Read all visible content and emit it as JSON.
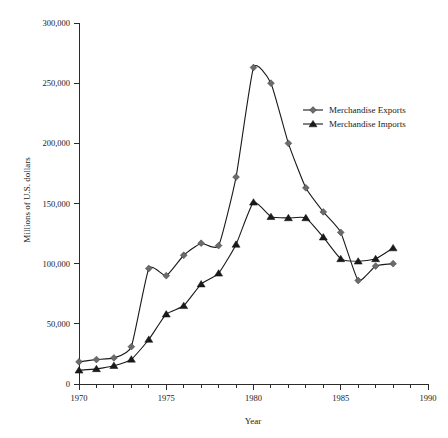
{
  "chart_data": {
    "type": "line",
    "title": "",
    "xlabel": "Year",
    "ylabel": "Millions of U.S. dollars",
    "xlim": [
      1970,
      1990
    ],
    "ylim": [
      0,
      300000
    ],
    "grid": false,
    "legend_position": "inside-right-upper",
    "x_major_ticks": [
      1970,
      1975,
      1980,
      1985,
      1990
    ],
    "x_major_tick_labels": [
      "1970",
      "1975",
      "1980",
      "1985",
      "1990"
    ],
    "x_minor_tick_step": 1,
    "y_ticks": [
      0,
      50000,
      100000,
      150000,
      200000,
      250000,
      300000
    ],
    "y_tick_labels": [
      "0",
      "50,000",
      "100,000",
      "150,000",
      "200,000",
      "250,000",
      "300,000"
    ],
    "x": [
      1970,
      1971,
      1972,
      1973,
      1974,
      1975,
      1976,
      1977,
      1978,
      1979,
      1980,
      1981,
      1982,
      1983,
      1984,
      1985,
      1986,
      1987,
      1988
    ],
    "series": [
      {
        "name": "Merchandise Exports",
        "marker": "diamond",
        "marker_color": "#6b6b6b",
        "line_color": "#1a1a1a",
        "values": [
          18400,
          20300,
          21700,
          31000,
          96000,
          90000,
          107000,
          117000,
          115000,
          172000,
          263000,
          250000,
          200000,
          163000,
          143000,
          126000,
          86000,
          98000,
          100000
        ]
      },
      {
        "name": "Merchandise Imports",
        "marker": "triangle",
        "marker_color": "#1a1a1a",
        "line_color": "#1a1a1a",
        "values": [
          11400,
          12600,
          15200,
          20500,
          37000,
          58000,
          65000,
          83000,
          92000,
          116000,
          151000,
          139000,
          138000,
          138000,
          122000,
          104000,
          102000,
          104000,
          113000
        ]
      }
    ]
  },
  "legend": {
    "entries": [
      {
        "label": "Merchandise Exports"
      },
      {
        "label": "Merchandise Imports"
      }
    ]
  },
  "axes": {
    "x_title": "Year",
    "y_title": "Millions of U.S. dollars"
  }
}
